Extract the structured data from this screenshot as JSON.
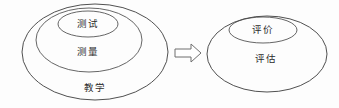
{
  "diagram": {
    "type": "nested-ellipse-venn",
    "background_color": "#fdfdfd",
    "stroke_color": "#3c3c3c",
    "text_color": "#2b2b2b",
    "left_group": {
      "name": "teaching-measurement-testing",
      "levels": [
        {
          "key": "outer",
          "label": "教学"
        },
        {
          "key": "middle",
          "label": "测量"
        },
        {
          "key": "inner",
          "label": "测试"
        }
      ]
    },
    "arrow": {
      "name": "implies-arrow",
      "direction": "right",
      "style": "hollow-block",
      "fill_color": "#ffffff",
      "stroke_color": "#6f6f6f"
    },
    "right_group": {
      "name": "assessment-evaluation",
      "levels": [
        {
          "key": "outer",
          "label": "评估"
        },
        {
          "key": "inner",
          "label": "评价"
        }
      ]
    }
  }
}
